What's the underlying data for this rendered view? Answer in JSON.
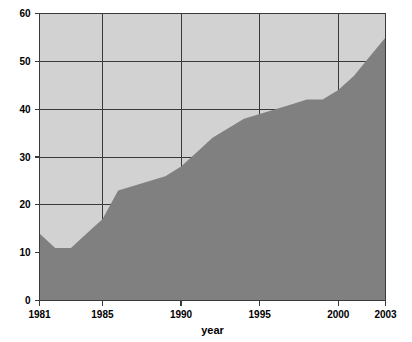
{
  "chart_data": {
    "type": "area",
    "title": "",
    "xlabel": "year",
    "ylabel": "",
    "xlim": [
      1981,
      2003
    ],
    "ylim": [
      0,
      60
    ],
    "grid": true,
    "legend": "none",
    "background_color": "#d2d2d2",
    "area_color": "#808080",
    "axis_color": "#3a3a3a",
    "x_tick_labels": [
      "1981",
      "1985",
      "1990",
      "1995",
      "2000",
      "2003"
    ],
    "x_tick_values": [
      1981,
      1985,
      1990,
      1995,
      2000,
      2003
    ],
    "y_tick_labels": [
      "0",
      "10",
      "20",
      "30",
      "40",
      "50",
      "60"
    ],
    "y_tick_values": [
      0,
      10,
      20,
      30,
      40,
      50,
      60
    ],
    "x": [
      1981,
      1982,
      1983,
      1984,
      1985,
      1986,
      1987,
      1988,
      1989,
      1990,
      1991,
      1992,
      1993,
      1994,
      1995,
      1996,
      1997,
      1998,
      1999,
      2000,
      2001,
      2002,
      2003
    ],
    "values": [
      14,
      11,
      11,
      14,
      17,
      23,
      24,
      25,
      26,
      28,
      31,
      34,
      36,
      38,
      39,
      40,
      41,
      42,
      42,
      44,
      47,
      51,
      55
    ],
    "series": [
      {
        "name": "series-1",
        "values": [
          14,
          11,
          11,
          14,
          17,
          23,
          24,
          25,
          26,
          28,
          31,
          34,
          36,
          38,
          39,
          40,
          41,
          42,
          42,
          44,
          47,
          51,
          55
        ]
      }
    ]
  },
  "axes": {
    "x_axis_label": "year"
  }
}
